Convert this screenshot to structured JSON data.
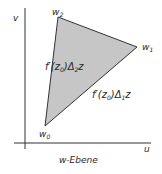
{
  "diagram": {
    "title": "w-Ebene",
    "axes": {
      "horizontal_label": "u",
      "vertical_label": "v"
    },
    "vertices": [
      {
        "id": "w0",
        "base": "w",
        "sub": "0"
      },
      {
        "id": "w1",
        "base": "w",
        "sub": "1"
      },
      {
        "id": "w2",
        "base": "w",
        "sub": "2"
      }
    ],
    "edge_labels": {
      "edge_w0_w2": {
        "prefix": "f′(z",
        "sub1": "0",
        "mid": ")Δ",
        "sub2": "2",
        "suffix": "z"
      },
      "edge_w0_w1": {
        "prefix": "f′(z",
        "sub1": "0",
        "mid": ")Δ",
        "sub2": "1",
        "suffix": "z"
      }
    },
    "colors": {
      "triangle_fill": "#c6c6c6",
      "lines": "#333333",
      "background": "#ffffff"
    }
  }
}
